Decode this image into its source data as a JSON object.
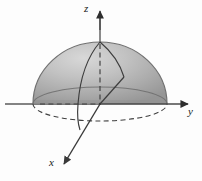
{
  "figure": {
    "background_color": "#fdfdfd",
    "width": 202,
    "height": 181,
    "axes": {
      "z": {
        "label": "z",
        "direction": "up",
        "arrow": true,
        "line_color": "#555555",
        "tip": {
          "x": 100,
          "y": 10
        },
        "origin": {
          "x": 100,
          "y": 104
        },
        "hidden_segment_style": "dashed"
      },
      "y": {
        "label": "y",
        "direction": "right",
        "arrow": true,
        "line_color": "#555555",
        "tip": {
          "x": 192,
          "y": 104
        },
        "origin": {
          "x": 100,
          "y": 104
        },
        "hidden_segment_style": "dashed"
      },
      "x": {
        "label": "x",
        "direction": "down-left",
        "arrow": true,
        "line_color": "#3a3a3a",
        "tip": {
          "x": 62,
          "y": 166
        },
        "origin": {
          "x": 100,
          "y": 104
        },
        "hidden_segment_style": "solid"
      }
    },
    "solid": {
      "name": "hemisphere",
      "description": "Shaded upper hemisphere (dome) resting on the xy-plane",
      "center": {
        "x": 100,
        "y": 104
      },
      "radius_x": 67,
      "radius_y": 62,
      "base_ellipse_ry": 17,
      "fill_top_color": "#b9b9b9",
      "fill_bottom_color": "#8f8f8f",
      "highlight_color": "#d2d2d2",
      "outline_color": "#6e6e6e",
      "equator_line_color": "#6a6a6a",
      "meridian_line_color": "#3c3c3c"
    },
    "curves": [
      {
        "name": "equator-ellipse",
        "style": "solid-and-dashed",
        "note": "front arc dashed, rear arc solid"
      },
      {
        "name": "meridian-left",
        "style": "solid"
      },
      {
        "name": "meridian-right",
        "style": "solid"
      },
      {
        "name": "radius-dashed-horizontal",
        "style": "dashed"
      }
    ]
  }
}
